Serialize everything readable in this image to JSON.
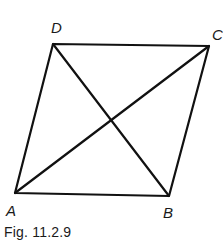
{
  "figure": {
    "caption": "Fig. 11.2.9",
    "stroke_color": "#111111",
    "vertices": {
      "A": {
        "label": "A",
        "x": 15,
        "y": 193
      },
      "B": {
        "label": "B",
        "x": 169,
        "y": 196
      },
      "C": {
        "label": "C",
        "x": 209,
        "y": 46
      },
      "D": {
        "label": "D",
        "x": 53,
        "y": 44
      }
    },
    "edges": [
      "AB",
      "BC",
      "CD",
      "DA"
    ],
    "diagonals": [
      "AC",
      "BD"
    ]
  }
}
